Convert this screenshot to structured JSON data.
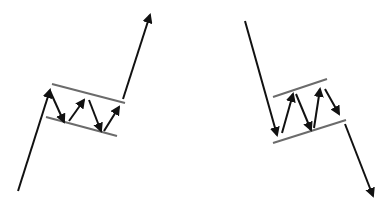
{
  "diagram": {
    "colors": {
      "arrow": "#111111",
      "channel": "#6b6b6b",
      "background": "#ffffff"
    },
    "bull_flag": {
      "label": "Bull flag",
      "pole": [
        [
          18,
          191
        ],
        [
          50,
          90
        ]
      ],
      "channel_upper": [
        [
          52,
          84
        ],
        [
          125,
          103
        ]
      ],
      "channel_lower": [
        [
          46,
          117
        ],
        [
          117,
          136
        ]
      ],
      "zigzag": [
        [
          [
            50,
            91
          ],
          [
            64,
            122
          ]
        ],
        [
          [
            69,
            121
          ],
          [
            84,
            100
          ]
        ],
        [
          [
            89,
            100
          ],
          [
            101,
            131
          ]
        ],
        [
          [
            104,
            131
          ],
          [
            119,
            107
          ]
        ]
      ],
      "breakout": [
        [
          123,
          99
        ],
        [
          150,
          15
        ]
      ]
    },
    "bear_flag": {
      "label": "Bear flag",
      "pole": [
        [
          245,
          21
        ],
        [
          277,
          135
        ]
      ],
      "channel_upper": [
        [
          273,
          97
        ],
        [
          327,
          79
        ]
      ],
      "channel_lower": [
        [
          273,
          143
        ],
        [
          346,
          120
        ]
      ],
      "zigzag": [
        [
          [
            282,
            133
          ],
          [
            293,
            94
          ]
        ],
        [
          [
            296,
            94
          ],
          [
            311,
            130
          ]
        ],
        [
          [
            314,
            128
          ],
          [
            320,
            89
          ]
        ],
        [
          [
            325,
            89
          ],
          [
            339,
            114
          ]
        ]
      ],
      "breakdown": [
        [
          345,
          124
        ],
        [
          373,
          196
        ]
      ]
    }
  }
}
